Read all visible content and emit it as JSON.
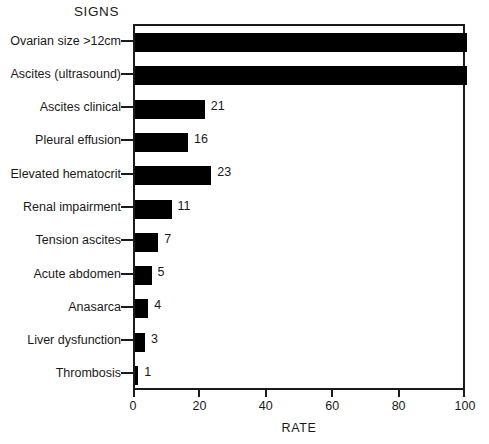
{
  "chart_data": {
    "type": "bar",
    "orientation": "horizontal",
    "title": "SIGNS",
    "xlabel": "RATE",
    "ylabel": "",
    "xlim": [
      0,
      100
    ],
    "xticks": [
      0,
      20,
      40,
      60,
      80,
      100
    ],
    "xticklabels": [
      "0",
      "20",
      "40",
      "60",
      "80",
      "100"
    ],
    "grid": false,
    "legend": false,
    "bar_color": "#000000",
    "axis_color": "#1a1a1a",
    "categories": [
      "Ovarian size >12cm",
      "Ascites (ultrasound)",
      "Ascites clinical",
      "Pleural effusion",
      "Elevated hematocrit",
      "Renal impairment",
      "Tension ascites",
      "Acute abdomen",
      "Anasarca",
      "Liver dysfunction",
      "Thrombosis"
    ],
    "values": [
      100,
      100,
      21,
      16,
      23,
      11,
      7,
      5,
      4,
      3,
      1
    ],
    "value_labels": [
      "",
      "",
      "21",
      "16",
      "23",
      "11",
      "7",
      "5",
      "4",
      "3",
      "1"
    ]
  }
}
